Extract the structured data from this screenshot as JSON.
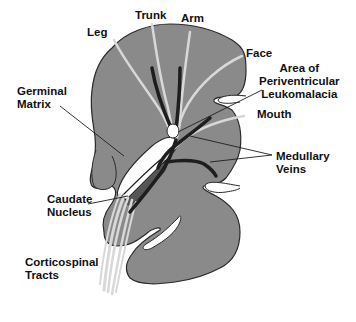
{
  "diagram": {
    "colors": {
      "brain_fill": "#8a8a8a",
      "brain_outline": "#2a2a2a",
      "fiber_tracts": "#d8d8d8",
      "veins": "#1e1e1e",
      "ventricle": "#ffffff",
      "caudate": "#5a5a5a",
      "text": "#111111"
    },
    "labels": {
      "leg": "Leg",
      "trunk": "Trunk",
      "arm": "Arm",
      "face": "Face",
      "pvl_line1": "Area of",
      "pvl_line2": "Periventricular",
      "pvl_line3": "Leukomalacia",
      "mouth": "Mouth",
      "germinal_line1": "Germinal",
      "germinal_line2": "Matrix",
      "medullary_line1": "Medullary",
      "medullary_line2": "Veins",
      "caudate_line1": "Caudate",
      "caudate_line2": "Nucleus",
      "cortico_line1": "Corticospinal",
      "cortico_line2": "Tracts"
    }
  }
}
